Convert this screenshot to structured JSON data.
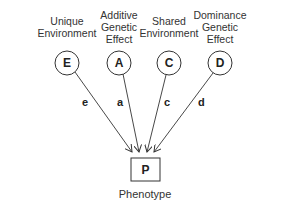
{
  "nodes": [
    {
      "id": "E",
      "letter": "E",
      "label": "Unique\nEnvironment",
      "path_label": "e",
      "cx": 67,
      "cy": 63
    },
    {
      "id": "A",
      "letter": "A",
      "label": "Additive\nGenetic\nEffect",
      "path_label": "a",
      "cx": 119,
      "cy": 63
    },
    {
      "id": "C",
      "letter": "C",
      "label": "Shared\nEnvironment",
      "path_label": "c",
      "cx": 169,
      "cy": 63
    },
    {
      "id": "D",
      "letter": "D",
      "label": "Dominance\nGenetic\nEffect",
      "path_label": "d",
      "cx": 220,
      "cy": 63
    }
  ],
  "outcome": {
    "letter": "P",
    "label": "Phenotype"
  }
}
